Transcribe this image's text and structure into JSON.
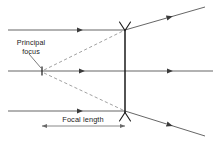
{
  "diagram": {
    "kind": "convex-mirror-ray-diagram",
    "canvas": {
      "width": 213,
      "height": 141,
      "background": "#ffffff"
    },
    "colors": {
      "ray_solid": "#4a4a4a",
      "ray_dashed": "#8a8a8a",
      "mirror": "#1a1a1a",
      "text": "#222222",
      "dimension": "#6a6a6a",
      "leader": "#5a5a5a"
    },
    "labels": {
      "principal_focus_line1": "Principal",
      "principal_focus_line2": "focus",
      "focal_length": "Focal length"
    },
    "geometry": {
      "mirror_x": 125,
      "mirror_top_y": 30,
      "mirror_bottom_y": 113,
      "focus_x": 42,
      "axis_y": 71,
      "ray_top_y": 30,
      "ray_bottom_y": 111,
      "ray_left_x": 8,
      "right_edge_x": 213,
      "dimension_y": 126
    },
    "elements": {
      "incident_rays": 3,
      "reflected_rays": 2,
      "virtual_dashed_rays": 2,
      "transmitted_axis_ray": 1
    }
  }
}
